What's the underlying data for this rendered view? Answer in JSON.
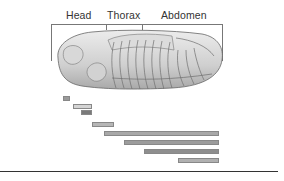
{
  "diagram": {
    "segments": [
      {
        "label": "Head"
      },
      {
        "label": "Thorax"
      },
      {
        "label": "Abdomen"
      }
    ],
    "embryo": {
      "name": "insect-embryo-illustration",
      "body_color": "#cfcfcf",
      "outline_color": "#555555"
    },
    "expression_bars": [
      {
        "x": 63,
        "y": 96,
        "w": 7,
        "color": "#9a9a9a"
      },
      {
        "x": 73,
        "y": 104,
        "w": 19,
        "color": "#d4d4d4"
      },
      {
        "x": 81,
        "y": 110,
        "w": 11,
        "color": "#7a7a7a"
      },
      {
        "x": 92,
        "y": 122,
        "w": 22,
        "color": "#b6b6b6"
      },
      {
        "x": 104,
        "y": 131,
        "w": 115,
        "color": "#a8a8a8"
      },
      {
        "x": 124,
        "y": 140,
        "w": 95,
        "color": "#9c9c9c"
      },
      {
        "x": 144,
        "y": 149,
        "w": 75,
        "color": "#8e8e8e"
      },
      {
        "x": 178,
        "y": 158,
        "w": 41,
        "color": "#b0b0b0"
      }
    ]
  }
}
